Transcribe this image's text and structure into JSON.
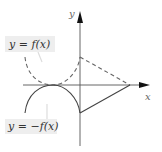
{
  "diagram": {
    "axes": {
      "x_label": "x",
      "y_label": "y"
    },
    "labels": {
      "f": "y = f(x)",
      "neg_f": "y = −f(x)"
    },
    "colors": {
      "stroke": "#444444",
      "dashed": "#666666",
      "label_bg": "#eeeeee",
      "pointer": "#dddddd"
    }
  }
}
